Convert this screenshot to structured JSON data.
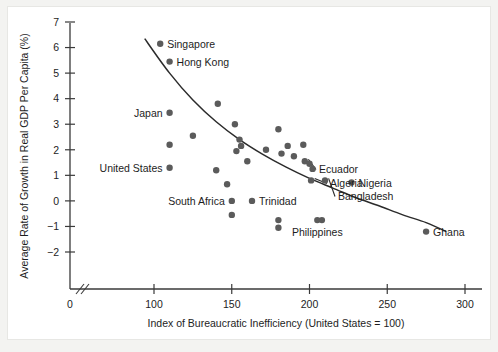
{
  "chart_data": {
    "type": "scatter",
    "title": "",
    "xlabel": "Index of Bureaucratic Inefficiency (United States = 100)",
    "ylabel": "Average Rate of Growth in Real GDP Per Capita (%)",
    "xlim": [
      90,
      305
    ],
    "ylim": [
      -2,
      7
    ],
    "x_ticks": [
      0,
      100,
      150,
      200,
      250,
      300
    ],
    "y_ticks": [
      -2,
      -1,
      0,
      1,
      2,
      3,
      4,
      5,
      6,
      7
    ],
    "x_tick_labels": [
      "0",
      "100",
      "150",
      "200",
      "250",
      "300"
    ],
    "y_tick_labels": [
      "-2",
      "-1",
      "0",
      "1",
      "2",
      "3",
      "4",
      "5",
      "6",
      "7"
    ],
    "grid": false,
    "legend": "none",
    "axis_break_x": true,
    "series": [
      {
        "name": "Countries",
        "points": [
          {
            "label": "Singapore",
            "x": 104,
            "y": 6.15,
            "label_side": "right"
          },
          {
            "label": "Hong Kong",
            "x": 110,
            "y": 5.45,
            "label_side": "right"
          },
          {
            "label": "Japan",
            "x": 110,
            "y": 3.45,
            "label_side": "left"
          },
          {
            "label": "United States",
            "x": 110,
            "y": 1.3,
            "label_side": "left"
          },
          {
            "label": "South Africa",
            "x": 150,
            "y": 0.0,
            "label_side": "left"
          },
          {
            "label": "Trinidad",
            "x": 163,
            "y": 0.0,
            "label_side": "right"
          },
          {
            "label": "Ecuador",
            "x": 197,
            "y": 1.55,
            "label_side": "leader"
          },
          {
            "label": "Algeria",
            "x": 201,
            "y": 0.8,
            "label_side": "leader"
          },
          {
            "label": "Bangladesh",
            "x": 210,
            "y": 0.8,
            "label_side": "leader"
          },
          {
            "label": "Nigeria",
            "x": 227,
            "y": 0.72,
            "label_side": "right"
          },
          {
            "label": "Philippines",
            "x": 205,
            "y": -0.75,
            "label_side": "below"
          },
          {
            "label": "Ghana",
            "x": 275,
            "y": -1.2,
            "label_side": "right"
          },
          {
            "label": "",
            "x": 110,
            "y": 2.2,
            "label_side": "none"
          },
          {
            "label": "",
            "x": 141,
            "y": 3.8,
            "label_side": "none"
          },
          {
            "label": "",
            "x": 125,
            "y": 2.55,
            "label_side": "none"
          },
          {
            "label": "",
            "x": 140,
            "y": 1.2,
            "label_side": "none"
          },
          {
            "label": "",
            "x": 147,
            "y": 0.65,
            "label_side": "none"
          },
          {
            "label": "",
            "x": 152,
            "y": 3.0,
            "label_side": "none"
          },
          {
            "label": "",
            "x": 155,
            "y": 2.4,
            "label_side": "none"
          },
          {
            "label": "",
            "x": 156,
            "y": 2.15,
            "label_side": "none"
          },
          {
            "label": "",
            "x": 153,
            "y": 1.95,
            "label_side": "none"
          },
          {
            "label": "",
            "x": 160,
            "y": 1.55,
            "label_side": "none"
          },
          {
            "label": "",
            "x": 150,
            "y": -0.55,
            "label_side": "none"
          },
          {
            "label": "",
            "x": 172,
            "y": 2.0,
            "label_side": "none"
          },
          {
            "label": "",
            "x": 180,
            "y": 2.8,
            "label_side": "none"
          },
          {
            "label": "",
            "x": 182,
            "y": 1.85,
            "label_side": "none"
          },
          {
            "label": "",
            "x": 186,
            "y": 2.15,
            "label_side": "none"
          },
          {
            "label": "",
            "x": 190,
            "y": 1.75,
            "label_side": "none"
          },
          {
            "label": "",
            "x": 196,
            "y": 2.2,
            "label_side": "none"
          },
          {
            "label": "",
            "x": 200,
            "y": 1.45,
            "label_side": "none"
          },
          {
            "label": "",
            "x": 202,
            "y": 1.25,
            "label_side": "none"
          },
          {
            "label": "",
            "x": 180,
            "y": -0.75,
            "label_side": "none"
          },
          {
            "label": "",
            "x": 180,
            "y": -1.05,
            "label_side": "none"
          },
          {
            "label": "",
            "x": 208,
            "y": -0.75,
            "label_side": "none"
          }
        ]
      }
    ],
    "trend_curve": [
      {
        "x": 94,
        "y": 6.35
      },
      {
        "x": 110,
        "y": 5.0
      },
      {
        "x": 125,
        "y": 3.95
      },
      {
        "x": 140,
        "y": 3.1
      },
      {
        "x": 155,
        "y": 2.4
      },
      {
        "x": 170,
        "y": 1.82
      },
      {
        "x": 185,
        "y": 1.32
      },
      {
        "x": 200,
        "y": 0.88
      },
      {
        "x": 215,
        "y": 0.5
      },
      {
        "x": 230,
        "y": 0.12
      },
      {
        "x": 245,
        "y": -0.2
      },
      {
        "x": 260,
        "y": -0.55
      },
      {
        "x": 275,
        "y": -0.85
      },
      {
        "x": 288,
        "y": -1.2
      }
    ],
    "colors": {
      "marker": "#5b5b5b",
      "curve": "#2b2b2b",
      "axis": "#3a3a3a",
      "text": "#1d1d1d",
      "plot_background": "#ffffff",
      "figure_background": "#f3f3f1"
    }
  }
}
